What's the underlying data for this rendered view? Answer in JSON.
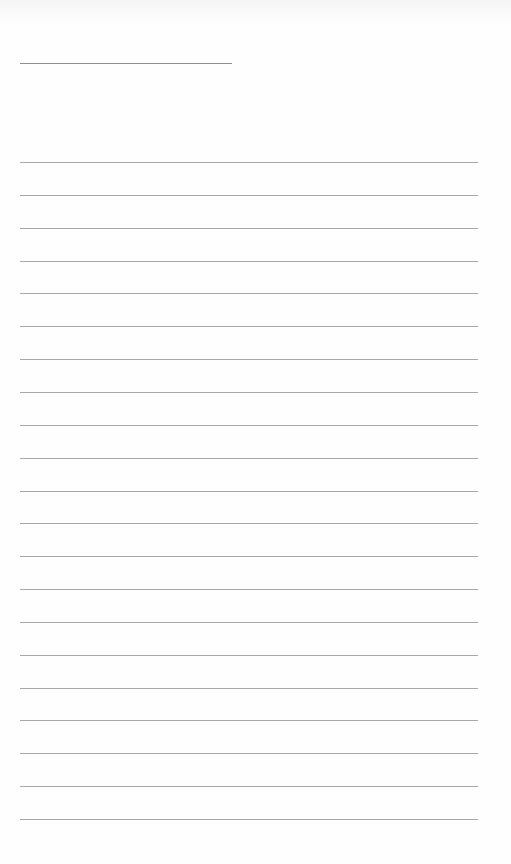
{
  "document": {
    "type": "lined-paper",
    "header_line": {
      "x": 20,
      "y": 63,
      "width": 212
    },
    "ruled_lines": {
      "count": 21,
      "start_y": 162,
      "spacing": 32.85,
      "x": 20,
      "width": 458
    },
    "colors": {
      "paper": "#fefefe",
      "header_line": "#8f8f8f",
      "rule": "#a8a8a8"
    }
  }
}
